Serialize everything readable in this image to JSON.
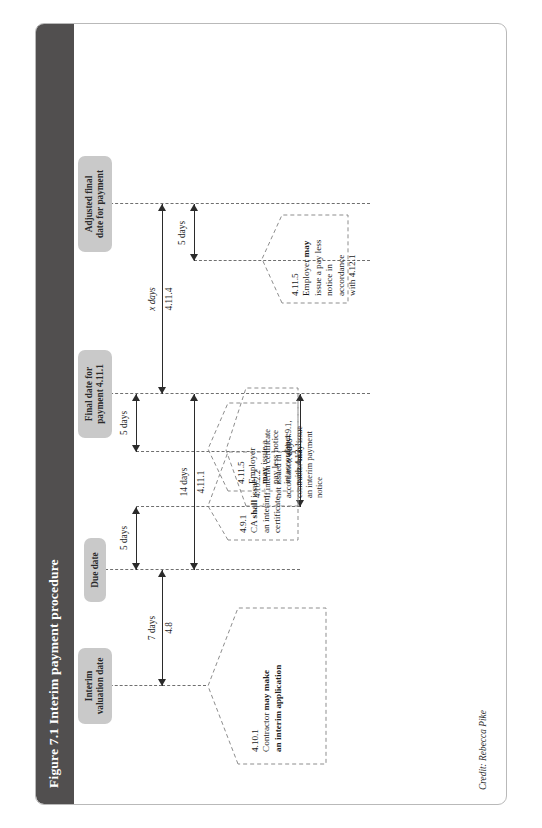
{
  "figure": {
    "number": "Figure 7.1",
    "title": "Figure 7.1  Interim payment procedure",
    "credit": "Credit: Rebecca Pike",
    "title_bar_color": "#514f4f",
    "chip_color": "#c9c9c9",
    "line_color": "#6f6f6f"
  },
  "milestones": [
    {
      "id": "interim-valuation-date",
      "label": "Interim\nvaluation date"
    },
    {
      "id": "due-date",
      "label": "Due date"
    },
    {
      "id": "final-date-for-payment",
      "label": "Final date for\npayment 4.11.1"
    },
    {
      "id": "adjusted-final-date",
      "label": "Adjusted final\ndate for payment"
    }
  ],
  "durations": [
    {
      "id": "d-7-days",
      "label": "7 days",
      "clause": "4.8",
      "italic_x": false
    },
    {
      "id": "d-5-days-cert",
      "label": "5 days",
      "clause": "",
      "italic_x": false
    },
    {
      "id": "d-14-days",
      "label": "14 days",
      "clause": "4.11.1",
      "italic_x": false
    },
    {
      "id": "d-5-days-pln",
      "label": "5 days",
      "clause": "",
      "italic_x": false
    },
    {
      "id": "d-x-days-final",
      "label": "x days",
      "clause": "4.11.4",
      "italic_x": true
    },
    {
      "id": "d-5-days-adj",
      "label": "5 days",
      "clause": "",
      "italic_x": false
    },
    {
      "id": "d-x-days-ipn",
      "label": "x days",
      "clause": "",
      "italic_x": true
    }
  ],
  "callouts": [
    {
      "id": "clause-4-10-1",
      "ref": "4.10.1",
      "lines": [
        {
          "text": "Contractor ",
          "bold": false
        },
        {
          "text": "may make",
          "bold": true
        },
        {
          "text": "an interim application",
          "bold": true
        }
      ],
      "plain": "4.10.1 Contractor may make an interim application"
    },
    {
      "id": "clause-4-9-1",
      "ref": "4.9.1",
      "lines": [
        {
          "text": "CA shall issue",
          "bold": false
        },
        {
          "text": "an interim",
          "bold": false
        },
        {
          "text": "certificate",
          "bold": false
        }
      ],
      "plain": "4.9.1 CA shall issue an interim certificate"
    },
    {
      "id": "clause-4-11-5-a",
      "ref": "4.11.5",
      "lines": [
        {
          "text": "Employer",
          "bold": false
        },
        {
          "text": "may issue a",
          "bold": false
        },
        {
          "text": "pay less notice",
          "bold": false
        },
        {
          "text": "in accordance",
          "bold": false
        },
        {
          "text": "with 4.12.1",
          "bold": false
        }
      ],
      "plain": "4.11.5 Employer may issue a pay less notice in accordance with 4.12.1"
    },
    {
      "id": "clause-4-10-2-2",
      "ref": "4.10.2.2",
      "lines": [
        {
          "text": "If interim certificate",
          "bold": false
        },
        {
          "text": "not issued in",
          "bold": false
        },
        {
          "text": "accordance with 4.9.1,",
          "bold": false
        },
        {
          "text": "contractor may issue",
          "bold": false
        },
        {
          "text": "an interim payment",
          "bold": false
        },
        {
          "text": "notice",
          "bold": false
        }
      ],
      "plain": "4.10.2.2 If interim certificate not issued in accordance with 4.9.1, contractor may issue an interim payment notice"
    },
    {
      "id": "clause-4-11-5-b",
      "ref": "4.11.5",
      "lines": [
        {
          "text": "Employer may",
          "bold": false
        },
        {
          "text": "issue a pay less",
          "bold": false
        },
        {
          "text": "notice in",
          "bold": false
        },
        {
          "text": "accordance",
          "bold": false
        },
        {
          "text": "with 4.12.1",
          "bold": false
        }
      ],
      "plain": "4.11.5 Employer may issue a pay less notice in accordance with 4.12.1"
    }
  ],
  "text": {
    "chip_interim_valuation_l1": "Interim",
    "chip_interim_valuation_l2": "valuation date",
    "chip_due_date": "Due date",
    "chip_final_date_l1": "Final date for",
    "chip_final_date_l2": "payment 4.11.1",
    "chip_adjusted_l1": "Adjusted final",
    "chip_adjusted_l2": "date for payment",
    "dur_7_days": "7 days",
    "dur_7_days_clause": "4.8",
    "dur_5_days_cert": "5 days",
    "dur_14_days": "14 days",
    "dur_14_days_clause": "4.11.1",
    "dur_5_days_pln": "5 days",
    "dur_x_days_final": "x days",
    "dur_x_days_final_clause": "4.11.4",
    "dur_5_days_adj": "5 days",
    "dur_x_days_ipn": "x days",
    "c1_ref": "4.10.1",
    "c1_l1": "Contractor ",
    "c1_l1b": "may make",
    "c1_l2b": "an interim application",
    "c2_ref": "4.9.1",
    "c2_l1a": "CA ",
    "c2_l1b": "shall",
    "c2_l1c": " issue",
    "c2_l2": "an interim",
    "c2_l3": "certificate",
    "c3_ref": "4.11.5",
    "c3_l1": "Employer",
    "c3_l2a": "may",
    "c3_l2b": " issue a",
    "c3_l3": "pay less notice",
    "c3_l4": "in accordance",
    "c3_l5": "with 4.12.1",
    "c4_ref": "4.10.2.2",
    "c4_l1": "If interim certificate",
    "c4_l2": "not issued in",
    "c4_l3": "accordance with 4.9.1,",
    "c4_l4a": "contractor ",
    "c4_l4b": "may",
    "c4_l4c": " issue",
    "c4_l5": "an interim payment",
    "c4_l6": "notice",
    "c5_ref": "4.11.5",
    "c5_l1a": "Employer ",
    "c5_l1b": "may",
    "c5_l2": "issue a pay less",
    "c5_l3": "notice in",
    "c5_l4": "accordance",
    "c5_l5": "with 4.12.1",
    "credit": "Credit: Rebecca Pike"
  }
}
